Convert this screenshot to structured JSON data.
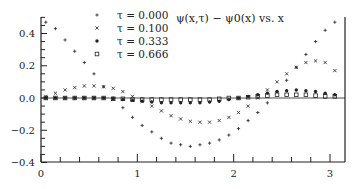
{
  "chart_data": {
    "type": "scatter",
    "title": "ψ(x,τ) − ψ0(x) vs. x",
    "xlabel": "",
    "ylabel": "",
    "xlim": [
      0,
      3.1416
    ],
    "ylim": [
      -0.4,
      0.5
    ],
    "x_ticks": [
      0,
      1,
      2,
      3
    ],
    "x_tick_labels": [
      "0",
      "1",
      "2",
      "3"
    ],
    "y_ticks": [
      -0.4,
      -0.2,
      0.0,
      0.2,
      0.4
    ],
    "y_tick_labels": [
      "−0.4",
      "−0.2",
      "0.0",
      "0.2",
      "0.4"
    ],
    "grid": false,
    "legend_position": "upper center",
    "x": [
      0.05,
      0.15,
      0.25,
      0.35,
      0.45,
      0.55,
      0.65,
      0.75,
      0.85,
      0.95,
      1.05,
      1.15,
      1.25,
      1.35,
      1.45,
      1.55,
      1.65,
      1.75,
      1.85,
      1.95,
      2.05,
      2.15,
      2.25,
      2.35,
      2.45,
      2.55,
      2.65,
      2.75,
      2.85,
      2.95,
      3.05
    ],
    "series": [
      {
        "name": "τ = 0.000",
        "marker": "+",
        "values": [
          0.47,
          0.43,
          0.36,
          0.29,
          0.22,
          0.15,
          0.07,
          0.0,
          -0.06,
          -0.12,
          -0.17,
          -0.21,
          -0.25,
          -0.28,
          -0.29,
          -0.3,
          -0.29,
          -0.28,
          -0.26,
          -0.23,
          -0.19,
          -0.14,
          -0.09,
          -0.03,
          0.04,
          0.11,
          0.19,
          0.27,
          0.35,
          0.42,
          0.47
        ]
      },
      {
        "name": "τ = 0.100",
        "marker": "×",
        "values": [
          0.01,
          0.03,
          0.05,
          0.065,
          0.075,
          0.075,
          0.07,
          0.06,
          0.04,
          0.01,
          -0.02,
          -0.05,
          -0.08,
          -0.11,
          -0.13,
          -0.145,
          -0.15,
          -0.15,
          -0.14,
          -0.12,
          -0.09,
          -0.05,
          0.0,
          0.05,
          0.1,
          0.15,
          0.19,
          0.22,
          0.23,
          0.22,
          0.17
        ]
      },
      {
        "name": "τ = 0.333",
        "marker": "*",
        "values": [
          0.0,
          0.0,
          0.0,
          0.0,
          0.0,
          0.0,
          0.0,
          -0.005,
          -0.01,
          -0.015,
          -0.02,
          -0.025,
          -0.03,
          -0.03,
          -0.03,
          -0.03,
          -0.03,
          -0.025,
          -0.02,
          -0.01,
          0.0,
          0.01,
          0.02,
          0.03,
          0.04,
          0.045,
          0.05,
          0.045,
          0.04,
          0.03,
          0.02
        ]
      },
      {
        "name": "τ = 0.666",
        "marker": "□",
        "values": [
          0.0,
          0.0,
          0.0,
          0.0,
          0.0,
          0.0,
          0.0,
          -0.005,
          -0.005,
          -0.01,
          -0.01,
          -0.01,
          -0.01,
          -0.01,
          -0.01,
          -0.01,
          -0.01,
          -0.01,
          -0.005,
          0.0,
          0.0,
          0.005,
          0.01,
          0.015,
          0.02,
          0.02,
          0.02,
          0.02,
          0.015,
          0.01,
          0.01
        ]
      }
    ]
  },
  "title": "ψ(x,τ) − ψ0(x) vs. x",
  "legend": [
    {
      "marker": "+",
      "label": "τ = 0.000"
    },
    {
      "marker": "×",
      "label": "τ = 0.100"
    },
    {
      "marker": "*",
      "label": "τ = 0.333"
    },
    {
      "marker": "□",
      "label": "τ = 0.666"
    }
  ]
}
